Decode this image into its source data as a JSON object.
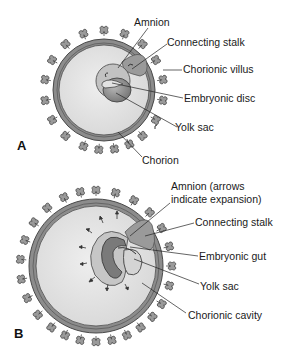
{
  "panels": [
    {
      "letter": "A",
      "labels": {
        "amnion": "Amnion",
        "connecting_stalk": "Connecting stalk",
        "chorionic_villus": "Chorionic villus",
        "embryonic_disc": "Embryonic disc",
        "yolk_sac": "Yolk sac",
        "chorion": "Chorion"
      }
    },
    {
      "letter": "B",
      "labels": {
        "amnion_line1": "Amnion (arrows",
        "amnion_line2": "indicate expansion)",
        "connecting_stalk": "Connecting stalk",
        "embryonic_gut": "Embryonic gut",
        "yolk_sac": "Yolk sac",
        "chorionic_cavity": "Chorionic cavity"
      }
    }
  ],
  "colors": {
    "chorion_ring": "#8c8c8c",
    "outline": "#4a4a4a",
    "cavity": "#e3e3e3",
    "stalk": "#9a9a9a",
    "embryo_dark": "#6e6e6e",
    "embryo_mid": "#a8a8a8",
    "leader_line": "#222222"
  }
}
